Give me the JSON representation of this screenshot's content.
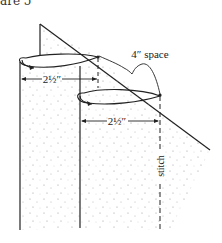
{
  "caption": "are 5",
  "labels": {
    "space": "4″ space",
    "width_top": "2½″",
    "width_bottom": "2½″",
    "stitch": "stitch"
  },
  "colors": {
    "line": "#222222",
    "dots": "#9a9a9a",
    "background": "#ffffff"
  }
}
